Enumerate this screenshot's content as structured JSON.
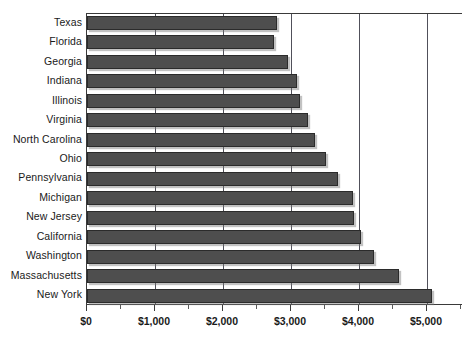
{
  "chart_data": {
    "type": "bar",
    "orientation": "horizontal",
    "title": "",
    "subtitle": "",
    "xlabel": "",
    "ylabel": "",
    "categories": [
      "Texas",
      "Florida",
      "Georgia",
      "Indiana",
      "Illinois",
      "Virginia",
      "North Carolina",
      "Ohio",
      "Pennsylvania",
      "Michigan",
      "New Jersey",
      "California",
      "Washington",
      "Massachusetts",
      "New York"
    ],
    "values": [
      2790,
      2750,
      2950,
      3090,
      3130,
      3250,
      3350,
      3510,
      3690,
      3910,
      3930,
      4030,
      4220,
      4590,
      5070
    ],
    "xlim": [
      0,
      5530
    ],
    "xticks": [
      0,
      1000,
      2000,
      3000,
      4000,
      5000
    ],
    "xticklabels": [
      "$0",
      "$1,000",
      "$2,000",
      "$3,000",
      "$4,000",
      "$5,000"
    ],
    "minor_ticks": [
      500,
      1500,
      2500,
      3500,
      4500,
      5500
    ],
    "gridlines": [
      1000,
      2000,
      3000,
      4000,
      5000
    ],
    "grid": true,
    "legend": null,
    "legend_position": "none",
    "colors": {
      "bar_fill": "#4e4e4e",
      "bar_border": "#2b2b2b",
      "gridline": "#50505a",
      "axis": "#3a3a3a",
      "text": "#1a1a1a",
      "background": "#ffffff"
    }
  }
}
